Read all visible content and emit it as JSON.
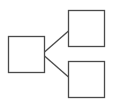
{
  "diagram": {
    "type": "tree",
    "stroke_color": "#4a4a4a",
    "background": "#ffffff",
    "nodes": [
      {
        "id": "root",
        "label": "",
        "x": 8,
        "y": 36,
        "w": 37,
        "h": 37
      },
      {
        "id": "child-top",
        "label": "",
        "x": 68,
        "y": 10,
        "w": 37,
        "h": 37
      },
      {
        "id": "child-bottom",
        "label": "",
        "x": 68,
        "y": 61,
        "w": 37,
        "h": 37
      }
    ],
    "edges": [
      {
        "from": "root",
        "to": "child-top"
      },
      {
        "from": "root",
        "to": "child-bottom"
      }
    ]
  }
}
